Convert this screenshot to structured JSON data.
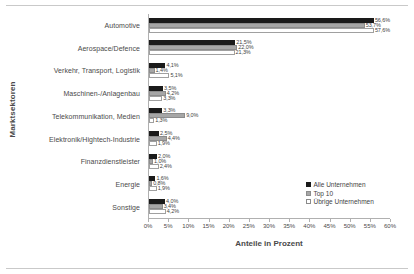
{
  "chart_data": {
    "type": "bar",
    "orientation": "horizontal",
    "title": "",
    "xlabel": "Anteile in Prozent",
    "ylabel": "Marktsektoren",
    "xlim": [
      0,
      60
    ],
    "xticks": [
      0,
      5,
      10,
      15,
      20,
      25,
      30,
      35,
      40,
      45,
      50,
      55,
      60
    ],
    "xtick_labels": [
      "0%",
      "5%",
      "10%",
      "15%",
      "20%",
      "25%",
      "30%",
      "35%",
      "40%",
      "45%",
      "50%",
      "55%",
      "60%"
    ],
    "grid": false,
    "legend_position": "bottom-right",
    "categories": [
      "Automotive",
      "Aerospace/Defence",
      "Verkehr, Transport, Logistik",
      "Maschinen-/Anlagenbau",
      "Telekommunikation, Medien",
      "Elektronik/Hightech-Industrie",
      "Finanzdienstleister",
      "Energie",
      "Sonstige"
    ],
    "series": [
      {
        "name": "Alle Unternehmen",
        "color": "#1a1a1a",
        "values": [
          56.6,
          21.5,
          4.1,
          3.5,
          3.3,
          2.5,
          2.0,
          1.6,
          4.0
        ],
        "labels": [
          "56,6%",
          "21,5%",
          "4,1%",
          "3,5%",
          "2,5%",
          "2,0%",
          "1,6%",
          "4,0%",
          "3,3%"
        ]
      },
      {
        "name": "Top 10",
        "color": "#a6a6a6",
        "values": [
          53.7,
          22.0,
          1.4,
          4.2,
          9.0,
          4.4,
          1.0,
          0.8,
          3.4
        ],
        "labels": [
          "53,7%",
          "22,0%",
          "1,4%",
          "4,2%",
          "9,0%",
          "4,4%",
          "1,0%",
          "0,8%",
          "3,4%"
        ]
      },
      {
        "name": "Übrige Unternehmen",
        "color": "#ffffff",
        "values": [
          57.6,
          21.3,
          5.1,
          3.3,
          1.3,
          1.9,
          2.4,
          1.9,
          4.2
        ],
        "labels": [
          "57,6%",
          "21,3%",
          "5,1%",
          "3,3%",
          "1,3%",
          "1,9%",
          "2,4%",
          "1,9%",
          "4,2%"
        ]
      }
    ],
    "data_labels": [
      [
        "56,6%",
        "53,7%",
        "57,6%"
      ],
      [
        "21,5%",
        "22,0%",
        "21,3%"
      ],
      [
        "4,1%",
        "1,4%",
        "5,1%"
      ],
      [
        "3,5%",
        "4,2%",
        "3,3%"
      ],
      [
        "3,3%",
        "9,0%",
        "1,3%"
      ],
      [
        "2,5%",
        "4,4%",
        "1,9%"
      ],
      [
        "2,0%",
        "1,0%",
        "2,4%"
      ],
      [
        "1,6%",
        "0,8%",
        "1,9%"
      ],
      [
        "4,0%",
        "3,4%",
        "4,2%"
      ]
    ]
  },
  "legend": {
    "items": [
      {
        "label": "Alle Unternehmen"
      },
      {
        "label": "Top 10"
      },
      {
        "label": "Übrige Unternehmen"
      }
    ]
  }
}
